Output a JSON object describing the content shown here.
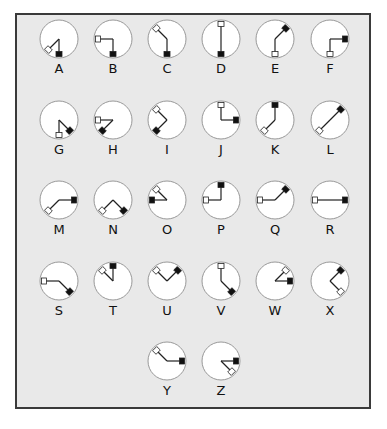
{
  "diagram": {
    "type": "semaphore-alphabet",
    "colors": {
      "frame_bg": "#e9e9e9",
      "frame_border": "#3a3a3a",
      "circle_fill": "#ffffff",
      "circle_stroke": "#999999",
      "arm": "#222222",
      "black_flag": "#111111",
      "white_flag": "#ffffff"
    },
    "letters": [
      {
        "label": "A",
        "white": 225,
        "black": 180
      },
      {
        "label": "B",
        "white": 270,
        "black": 180
      },
      {
        "label": "C",
        "white": 315,
        "black": 180
      },
      {
        "label": "D",
        "white": 0,
        "black": 180
      },
      {
        "label": "E",
        "white": 180,
        "black": 45
      },
      {
        "label": "F",
        "white": 180,
        "black": 90
      },
      {
        "label": "G",
        "white": 180,
        "black": 135
      },
      {
        "label": "H",
        "white": 270,
        "black": 225
      },
      {
        "label": "I",
        "white": 315,
        "black": 225
      },
      {
        "label": "J",
        "white": 0,
        "black": 90
      },
      {
        "label": "K",
        "white": 225,
        "black": 0
      },
      {
        "label": "L",
        "white": 225,
        "black": 45
      },
      {
        "label": "M",
        "white": 225,
        "black": 90
      },
      {
        "label": "N",
        "white": 225,
        "black": 135
      },
      {
        "label": "O",
        "white": 315,
        "black": 270
      },
      {
        "label": "P",
        "white": 270,
        "black": 0
      },
      {
        "label": "Q",
        "white": 270,
        "black": 45
      },
      {
        "label": "R",
        "white": 270,
        "black": 90
      },
      {
        "label": "S",
        "white": 270,
        "black": 135
      },
      {
        "label": "T",
        "white": 315,
        "black": 0
      },
      {
        "label": "U",
        "white": 315,
        "black": 45
      },
      {
        "label": "V",
        "white": 0,
        "black": 135
      },
      {
        "label": "W",
        "white": 45,
        "black": 90
      },
      {
        "label": "X",
        "white": 135,
        "black": 45
      },
      {
        "label": "Y",
        "white": 315,
        "black": 90
      },
      {
        "label": "Z",
        "white": 135,
        "black": 90
      }
    ]
  }
}
